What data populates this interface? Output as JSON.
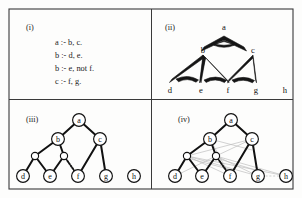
{
  "figure": {
    "caption_tags": [
      "(i)",
      "(ii)",
      "(iii)",
      "(iv)"
    ],
    "panels": {
      "i": {
        "tag": "(i)",
        "kind": "logic-program-text",
        "rules": [
          "a  :- b, c.",
          "b  :- d, e.",
          "b  :- e, not f.",
          "c  :- f, g."
        ]
      },
      "ii": {
        "tag": "(ii)",
        "kind": "hypergraph",
        "nodes": [
          {
            "id": "a",
            "label": "a",
            "x": 224,
            "y": 31
          },
          {
            "id": "b",
            "label": "b",
            "x": 203,
            "y": 50
          },
          {
            "id": "c",
            "label": "c",
            "x": 253,
            "y": 50
          },
          {
            "id": "d",
            "label": "d",
            "x": 170,
            "y": 85
          },
          {
            "id": "e",
            "label": "e",
            "x": 201,
            "y": 85
          },
          {
            "id": "f",
            "label": "f",
            "x": 228,
            "y": 85
          },
          {
            "id": "g",
            "label": "g",
            "x": 256,
            "y": 85
          },
          {
            "id": "h",
            "label": "h",
            "x": 285,
            "y": 85
          }
        ],
        "hyperedges": [
          {
            "head": "a",
            "body": [
              "b",
              "c"
            ]
          },
          {
            "head": "b",
            "body": [
              "d",
              "e"
            ]
          },
          {
            "head": "b",
            "body": [
              "e",
              "f"
            ]
          },
          {
            "head": "c",
            "body": [
              "f",
              "g"
            ]
          }
        ]
      },
      "iii": {
        "tag": "(iii)",
        "kind": "tree",
        "nodes": [
          {
            "id": "a",
            "label": "a",
            "x": 79,
            "y": 120,
            "r": 6.4
          },
          {
            "id": "b",
            "label": "b",
            "x": 58,
            "y": 139,
            "r": 6.4
          },
          {
            "id": "c",
            "label": "c",
            "x": 100,
            "y": 139,
            "r": 6.4
          },
          {
            "id": "n1",
            "label": "",
            "x": 35,
            "y": 156,
            "r": 3.6
          },
          {
            "id": "n2",
            "label": "",
            "x": 64,
            "y": 156,
            "r": 3.6
          },
          {
            "id": "d",
            "label": "d",
            "x": 23,
            "y": 176,
            "r": 6.4
          },
          {
            "id": "e",
            "label": "e",
            "x": 50,
            "y": 176,
            "r": 6.4
          },
          {
            "id": "f",
            "label": "f",
            "x": 78,
            "y": 176,
            "r": 6.4
          },
          {
            "id": "g",
            "label": "g",
            "x": 106,
            "y": 176,
            "r": 6.4
          },
          {
            "id": "h",
            "label": "h",
            "x": 134,
            "y": 176,
            "r": 6.4
          }
        ],
        "edges": [
          {
            "from": "a",
            "to": "b",
            "style": "solid"
          },
          {
            "from": "a",
            "to": "c",
            "style": "solid"
          },
          {
            "from": "b",
            "to": "n1",
            "style": "solid"
          },
          {
            "from": "b",
            "to": "n2",
            "style": "solid"
          },
          {
            "from": "n1",
            "to": "d",
            "style": "solid"
          },
          {
            "from": "n1",
            "to": "e",
            "style": "solid"
          },
          {
            "from": "n2",
            "to": "e",
            "style": "solid"
          },
          {
            "from": "n2",
            "to": "f",
            "style": "dotted"
          },
          {
            "from": "c",
            "to": "f",
            "style": "solid"
          },
          {
            "from": "c",
            "to": "g",
            "style": "solid"
          }
        ]
      },
      "iv": {
        "tag": "(iv)",
        "kind": "tree-with-ghost-edges",
        "nodes": [
          {
            "id": "a",
            "label": "a",
            "x": 231,
            "y": 120,
            "r": 6.4
          },
          {
            "id": "b",
            "label": "b",
            "x": 210,
            "y": 139,
            "r": 6.4
          },
          {
            "id": "c",
            "label": "c",
            "x": 252,
            "y": 139,
            "r": 6.4
          },
          {
            "id": "n1",
            "label": "",
            "x": 187,
            "y": 156,
            "r": 3.6
          },
          {
            "id": "n2",
            "label": "",
            "x": 216,
            "y": 156,
            "r": 3.6
          },
          {
            "id": "d",
            "label": "d",
            "x": 175,
            "y": 176,
            "r": 6.4
          },
          {
            "id": "e",
            "label": "e",
            "x": 202,
            "y": 176,
            "r": 6.4
          },
          {
            "id": "f",
            "label": "f",
            "x": 230,
            "y": 176,
            "r": 6.4
          },
          {
            "id": "g",
            "label": "g",
            "x": 258,
            "y": 176,
            "r": 6.4
          },
          {
            "id": "h",
            "label": "h",
            "x": 286,
            "y": 176,
            "r": 6.4
          }
        ],
        "edges": [
          {
            "from": "a",
            "to": "b",
            "style": "solid"
          },
          {
            "from": "a",
            "to": "c",
            "style": "solid"
          },
          {
            "from": "b",
            "to": "n1",
            "style": "solid"
          },
          {
            "from": "b",
            "to": "n2",
            "style": "solid"
          },
          {
            "from": "n1",
            "to": "d",
            "style": "solid"
          },
          {
            "from": "n1",
            "to": "e",
            "style": "solid"
          },
          {
            "from": "n2",
            "to": "e",
            "style": "solid"
          },
          {
            "from": "n2",
            "to": "f",
            "style": "dotted"
          },
          {
            "from": "c",
            "to": "f",
            "style": "solid"
          },
          {
            "from": "c",
            "to": "g",
            "style": "solid"
          }
        ],
        "ghost_edges": [
          {
            "from": "n1",
            "to": "f"
          },
          {
            "from": "n1",
            "to": "g"
          },
          {
            "from": "n1",
            "to": "c"
          },
          {
            "from": "n2",
            "to": "g"
          },
          {
            "from": "n2",
            "to": "c"
          },
          {
            "from": "n2",
            "to": "h"
          },
          {
            "from": "n1",
            "to": "h"
          },
          {
            "from": "b",
            "to": "f"
          },
          {
            "from": "b",
            "to": "g"
          },
          {
            "from": "g",
            "to": "h"
          },
          {
            "from": "n2",
            "to": "d"
          }
        ]
      }
    },
    "colors": {
      "frame": "#3a3a3a",
      "ink": "#111111",
      "ghost": "#b9b9b9",
      "paper": "#fdfdfc"
    }
  }
}
